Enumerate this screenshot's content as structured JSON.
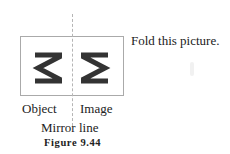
{
  "instruction": "Fold this picture.",
  "figure": {
    "object_label": "Object",
    "image_label": "Image",
    "mirror_label": "Mirror line",
    "caption": "Figure 9.44",
    "object_glyph": "reversed-sigma-icon",
    "image_glyph": "sigma-icon",
    "stroke_color": "#333333",
    "box_border_color": "#aaaaaa",
    "mirror_line_color": "#b5b5b5"
  }
}
